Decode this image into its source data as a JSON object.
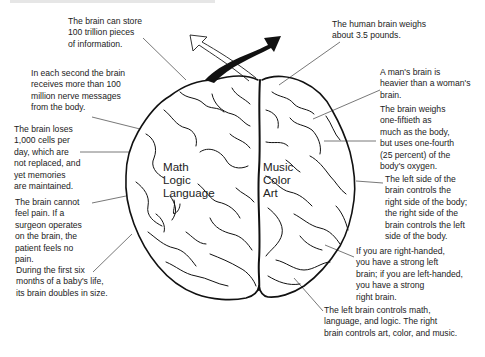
{
  "diagram": {
    "colors": {
      "ink": "#1a1a1a",
      "text": "#222222",
      "leader_line": "#555555",
      "background": "#ffffff"
    },
    "icons": {
      "left_arrow": "hollow-arrow-up-left",
      "right_arrow": "solid-arrow-up-right"
    }
  },
  "brain": {
    "left_hemisphere": {
      "lines": "Math\nLogic\nLanguage"
    },
    "right_hemisphere": {
      "lines": "Music\nColor\nArt"
    }
  },
  "annotations": {
    "left": [
      {
        "id": "storage",
        "text": "The brain can store\n100 trillion pieces\nof information."
      },
      {
        "id": "nerve-messages",
        "text": "In each second the brain\nreceives more than 100\nmillion nerve messages\nfrom the body."
      },
      {
        "id": "cell-loss",
        "text": "The brain loses\n1,000 cells per\nday, which are\nnot replaced, and\nyet memories\nare maintained."
      },
      {
        "id": "no-pain",
        "text": "The brain cannot\nfeel pain.  If a\nsurgeon operates\non the brain, the\npatient feels no\npain."
      },
      {
        "id": "baby-growth",
        "text": "During the first six\nmonths of a baby's life,\nits brain doubles in size."
      }
    ],
    "right": [
      {
        "id": "weight",
        "text": "The human brain weighs\nabout 3.5 pounds."
      },
      {
        "id": "man-vs-woman",
        "text": "A man's brain is\nheavier than a woman's\nbrain."
      },
      {
        "id": "oxygen",
        "text": "The brain weighs\none-fiftieth as\nmuch as the body,\nbut uses one-fourth\n(25 percent) of the\nbody's oxygen."
      },
      {
        "id": "cross-control",
        "text": "The left side of the\nbrain controls the\nright side of the body;\nthe right side of the\nbrain controls the left\nside of the body."
      },
      {
        "id": "handedness",
        "text": "If you are right-handed,\nyou have a strong left\nbrain; if you are left-handed,\nyou have a strong\nright brain."
      },
      {
        "id": "functions",
        "text": "The left brain controls math,\nlanguage, and logic.  The right\nbrain controls art, color, and music."
      }
    ]
  }
}
